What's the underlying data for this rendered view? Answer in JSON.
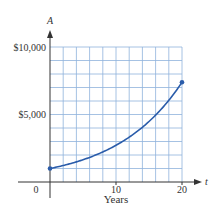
{
  "chart_data": {
    "type": "line",
    "title": "",
    "xlabel": "Years",
    "ylabel": "",
    "x_axis_variable": "t",
    "y_axis_variable": "A",
    "xlim": [
      0,
      20
    ],
    "ylim": [
      0,
      10000
    ],
    "x_ticks": [
      0,
      10,
      20
    ],
    "x_tick_labels": [
      "0",
      "10",
      "20"
    ],
    "y_ticks": [
      5000,
      10000
    ],
    "y_tick_labels": [
      "$5,000",
      "$10,000"
    ],
    "grid": true,
    "grid_x_step": 2,
    "grid_y_step": 1000,
    "legend": null,
    "series": [
      {
        "name": "A(t)",
        "color": "#2a5caa",
        "x": [
          0,
          2,
          4,
          6,
          8,
          10,
          12,
          14,
          16,
          18,
          20
        ],
        "values": [
          1000,
          1221,
          1492,
          1822,
          2226,
          2718,
          3320,
          4055,
          4953,
          6050,
          7389
        ],
        "endpoints_marked": true
      }
    ]
  },
  "colors": {
    "grid": "#8fb3dc",
    "axis": "#333333",
    "curve": "#2a5caa"
  }
}
